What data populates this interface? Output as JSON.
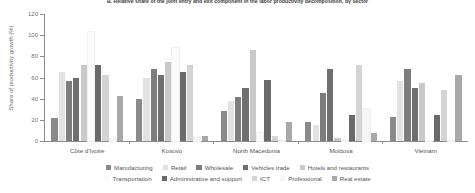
{
  "chart_data": {
    "type": "bar",
    "title": "B. Relative share of the joint entry and exit component in the labor productivity decomposition, by sector",
    "xlabel": "",
    "ylabel": "Share of productivity growth (%)",
    "ylim": [
      0,
      120
    ],
    "yticks": [
      0,
      20,
      40,
      60,
      80,
      100,
      120
    ],
    "grid": false,
    "legend_position": "bottom",
    "categories": [
      "Côte d'Ivoire",
      "Kosovo",
      "North Macedonia",
      "Moldova",
      "Vietnam"
    ],
    "series": [
      {
        "name": "Manufacturing",
        "color": "#8a8a8a",
        "values": [
          22,
          40,
          28,
          18,
          23
        ]
      },
      {
        "name": "Retail",
        "color": "#e2e2e2",
        "values": [
          65,
          60,
          38,
          15,
          57
        ]
      },
      {
        "name": "Wholesale",
        "color": "#7d7d7d",
        "values": [
          57,
          68,
          42,
          45,
          68
        ]
      },
      {
        "name": "Vehicles trade",
        "color": "#6f6f6f",
        "values": [
          60,
          62,
          50,
          68,
          50
        ]
      },
      {
        "name": "Hotels and restaurants",
        "color": "#c9c9c9",
        "values": [
          72,
          75,
          86,
          3,
          55
        ]
      },
      {
        "name": "Transportation",
        "color": "#fbfbfb",
        "values": [
          103,
          88,
          8,
          0,
          0
        ]
      },
      {
        "name": "Administrative and support",
        "color": "#6a6a6a",
        "values": [
          72,
          65,
          58,
          25,
          25
        ]
      },
      {
        "name": "ICT",
        "color": "#d4d4d4",
        "values": [
          62,
          72,
          5,
          72,
          48
        ]
      },
      {
        "name": "Professional",
        "color": "#f6f6f6",
        "values": [
          2,
          4,
          0,
          30,
          0
        ]
      },
      {
        "name": "Real estate",
        "color": "#a8a8a8",
        "values": [
          43,
          5,
          18,
          8,
          62
        ]
      }
    ]
  }
}
